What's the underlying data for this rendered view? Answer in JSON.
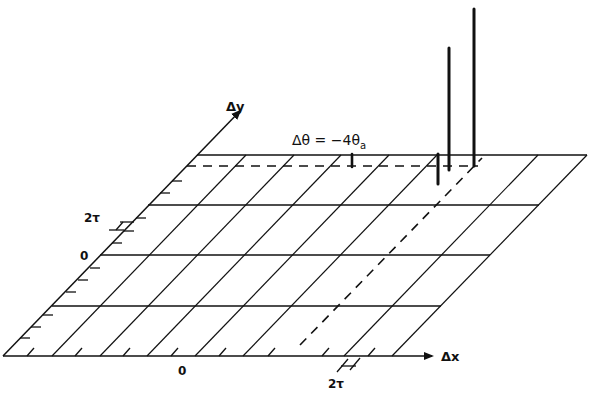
{
  "figure": {
    "type": "3D perspective grid diagram",
    "axes": {
      "x_label": "Δx",
      "y_label": "Δy"
    },
    "x_ticks": {
      "origin": "0",
      "spacing_label": "2τ"
    },
    "y_ticks": {
      "origin": "0",
      "spacing_label": "2τ"
    },
    "annotation": "Δθ = −4θ",
    "annotation_subscript": "a",
    "spikes": [
      {
        "name": "small-marker",
        "relative_height": "short"
      },
      {
        "name": "tall-spike",
        "relative_height": "medium"
      },
      {
        "name": "tallest-spike",
        "relative_height": "tall"
      }
    ],
    "colors": {
      "ink": "#111111",
      "background": "#ffffff"
    }
  }
}
